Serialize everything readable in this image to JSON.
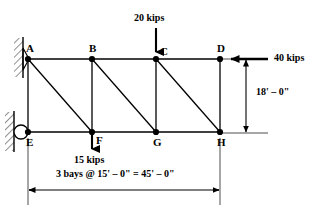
{
  "figure": {
    "line_color": "#000000",
    "background": "#ffffff"
  },
  "nodes": [
    {
      "id": "A",
      "label": "A",
      "x": 28,
      "y": 59,
      "label_dx": -2,
      "label_dy": -16
    },
    {
      "id": "B",
      "label": "B",
      "x": 92,
      "y": 59,
      "label_dx": -3,
      "label_dy": -16
    },
    {
      "id": "C",
      "label": "C",
      "x": 156,
      "y": 59,
      "label_dx": 4,
      "label_dy": -13
    },
    {
      "id": "D",
      "label": "D",
      "x": 220,
      "y": 59,
      "label_dx": -3,
      "label_dy": -16
    },
    {
      "id": "E",
      "label": "E",
      "x": 28,
      "y": 132,
      "label_dx": -2,
      "label_dy": 5
    },
    {
      "id": "F",
      "label": "F",
      "x": 92,
      "y": 132,
      "label_dx": 4,
      "label_dy": 3
    },
    {
      "id": "G",
      "label": "G",
      "x": 156,
      "y": 132,
      "label_dx": -3,
      "label_dy": 5
    },
    {
      "id": "H",
      "label": "H",
      "x": 220,
      "y": 132,
      "label_dx": -3,
      "label_dy": 5
    }
  ],
  "members": [
    {
      "from": "A",
      "to": "B",
      "kind": "top-chord"
    },
    {
      "from": "B",
      "to": "C",
      "kind": "top-chord"
    },
    {
      "from": "C",
      "to": "D",
      "kind": "top-chord"
    },
    {
      "from": "E",
      "to": "F",
      "kind": "bottom-chord"
    },
    {
      "from": "F",
      "to": "G",
      "kind": "bottom-chord"
    },
    {
      "from": "G",
      "to": "H",
      "kind": "bottom-chord"
    },
    {
      "from": "A",
      "to": "E",
      "kind": "vertical"
    },
    {
      "from": "B",
      "to": "F",
      "kind": "vertical"
    },
    {
      "from": "C",
      "to": "G",
      "kind": "vertical"
    },
    {
      "from": "D",
      "to": "H",
      "kind": "vertical"
    },
    {
      "from": "A",
      "to": "F",
      "kind": "diagonal"
    },
    {
      "from": "B",
      "to": "G",
      "kind": "diagonal"
    },
    {
      "from": "C",
      "to": "H",
      "kind": "diagonal"
    }
  ],
  "supports": [
    {
      "at": "A",
      "type": "pin",
      "name": "pin-support"
    },
    {
      "at": "E",
      "type": "roller",
      "name": "roller-support"
    }
  ],
  "loads": [
    {
      "id": "load-20-kips",
      "label": "20 kips",
      "magnitude": 20,
      "unit": "kips",
      "direction": "down",
      "at": "C",
      "label_x": 134,
      "label_y": 16,
      "arrow_x": 156,
      "arrow_from_y": 28,
      "arrow_to_y": 57
    },
    {
      "id": "load-40-kips",
      "label": "40 kips",
      "magnitude": 40,
      "unit": "kips",
      "direction": "left",
      "at": "D",
      "label_x": 274,
      "label_y": 54,
      "arrow_y": 59,
      "arrow_from_x": 268,
      "arrow_to_x": 223
    },
    {
      "id": "load-15-kips",
      "label": "15 kips",
      "magnitude": 15,
      "unit": "kips",
      "direction": "down",
      "at": "F",
      "label_x": 76,
      "label_y": 158,
      "arrow_x": 92,
      "arrow_from_y": 132,
      "arrow_to_y": 154
    }
  ],
  "dimensions": [
    {
      "id": "vertical-height-dim",
      "label": "18' – 0\"",
      "orientation": "vertical",
      "x": 246,
      "from_y": 60,
      "to_y": 133,
      "label_x": 256,
      "label_y": 92,
      "ext_top_y": 59,
      "ext_bot_y": 133,
      "ext_from_x": 222,
      "ext_to_x": 268
    },
    {
      "id": "span-dim",
      "label": "3 bays @ 15' – 0\"  =  45' – 0\"",
      "orientation": "horizontal",
      "y": 190,
      "from_x": 29,
      "to_x": 219,
      "label_x": 59,
      "label_y": 172,
      "ext_left_x": 28,
      "ext_right_x": 220,
      "ext_from_y": 134,
      "ext_to_y": 205
    }
  ]
}
